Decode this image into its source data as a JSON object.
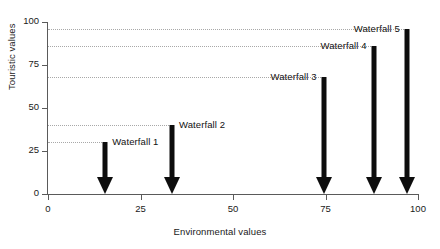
{
  "chart_data": {
    "type": "scatter",
    "title": "",
    "xlabel": "Environmental values",
    "ylabel": "Touristic values",
    "xlim": [
      0,
      100
    ],
    "ylim": [
      0,
      100
    ],
    "xticks": [
      "0",
      "25",
      "50",
      "75",
      "100"
    ],
    "yticks": [
      "0",
      "25",
      "50",
      "75",
      "100"
    ],
    "xtick_values": [
      0,
      25,
      50,
      75,
      100
    ],
    "ytick_values": [
      0,
      25,
      50,
      75,
      100
    ],
    "grid": "horizontal-dotted-to-point",
    "legend": "none",
    "marker_style": "downward-arrow-from-value-to-axis",
    "categories": [
      "Waterfall 1",
      "Waterfall 2",
      "Waterfall 3",
      "Waterfall 4",
      "Waterfall 5"
    ],
    "series": [
      {
        "name": "Environmental values",
        "values": [
          15.5,
          33.5,
          74.5,
          88,
          97
        ]
      },
      {
        "name": "Touristic values",
        "values": [
          30,
          40,
          68,
          86,
          96
        ]
      }
    ],
    "points": [
      {
        "label": "Waterfall 1",
        "x": 15.5,
        "y": 30
      },
      {
        "label": "Waterfall 2",
        "x": 33.5,
        "y": 40
      },
      {
        "label": "Waterfall 3",
        "x": 74.5,
        "y": 68
      },
      {
        "label": "Waterfall 4",
        "x": 88,
        "y": 86
      },
      {
        "label": "Waterfall 5",
        "x": 97,
        "y": 96
      }
    ],
    "colors": {
      "arrow": "#0d0d0d",
      "axis": "#5a5a5a",
      "gridline": "#a8a8a8",
      "text": "#1a1a1a",
      "background": "#ffffff"
    }
  }
}
